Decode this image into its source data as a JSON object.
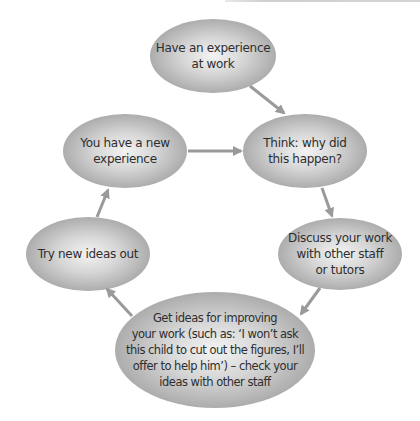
{
  "diagram": {
    "colors": {
      "node_center": "#f2f2f2",
      "node_edge": "#a6a6a6",
      "arrow": "#9a9a9a",
      "text": "#2e2e2e"
    },
    "nodes": [
      {
        "id": "experience",
        "label": "Have an experience at work",
        "lines": [
          "Have an experience",
          "at work"
        ]
      },
      {
        "id": "think",
        "label": "Think: why did this happen?",
        "lines": [
          "Think: why did",
          "this happen?"
        ]
      },
      {
        "id": "discuss",
        "label": "Discuss your work with other staff or tutors",
        "lines": [
          "Discuss your work",
          "with other staff",
          "or tutors"
        ]
      },
      {
        "id": "get-ideas",
        "label": "Get ideas for improving your work (such as: 'I won't ask this child to cut out the figures, I'll offer to help him') – check your ideas with other staff",
        "lines": [
          "Get ideas for improving",
          "your work (such as: ‘I won’t ask",
          "this child to cut out the figures, I’ll",
          "offer to help him’) – check your",
          "ideas with other staff"
        ]
      },
      {
        "id": "try",
        "label": "Try new ideas out",
        "lines": [
          "Try new ideas out"
        ]
      },
      {
        "id": "new-experience",
        "label": "You have a new experience",
        "lines": [
          "You have a new",
          "experience"
        ]
      }
    ],
    "edges": [
      {
        "from": "experience",
        "to": "think"
      },
      {
        "from": "think",
        "to": "discuss"
      },
      {
        "from": "discuss",
        "to": "get-ideas"
      },
      {
        "from": "get-ideas",
        "to": "try"
      },
      {
        "from": "try",
        "to": "new-experience"
      },
      {
        "from": "new-experience",
        "to": "think"
      }
    ]
  }
}
